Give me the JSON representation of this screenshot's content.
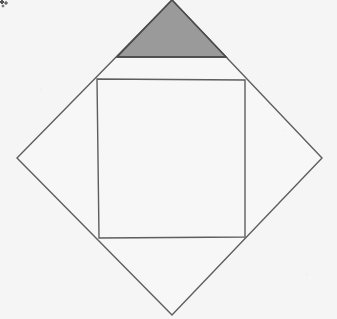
{
  "figure": {
    "canvas": {
      "width": 337,
      "height": 319,
      "background_color": "#f5f5f5"
    },
    "style": {
      "stroke_color": "#5e5e5e",
      "stroke_width": 1.4,
      "shaded_fill_color": "#9a9a9a",
      "unshaded_fill_color": "#f7f7f7"
    },
    "outer_square": {
      "name": "outer-rotated-square",
      "points": "172,0 322,158 172,315 17,158",
      "vertices": [
        {
          "label": "top",
          "x": 172,
          "y": 0
        },
        {
          "label": "right",
          "x": 322,
          "y": 158
        },
        {
          "label": "bottom",
          "x": 172,
          "y": 315
        },
        {
          "label": "left",
          "x": 17,
          "y": 158
        }
      ]
    },
    "inner_cross": {
      "name": "inner-midpoint-square",
      "points": "97,79 245,80 245,237 99,238",
      "vertices": [
        {
          "label": "upper-left-midpoint",
          "x": 97,
          "y": 79
        },
        {
          "label": "upper-right-midpoint",
          "x": 245,
          "y": 80
        },
        {
          "label": "lower-right-midpoint",
          "x": 245,
          "y": 237
        },
        {
          "label": "lower-left-midpoint",
          "x": 99,
          "y": 238
        }
      ],
      "center": {
        "x": 171,
        "y": 158
      }
    },
    "diagonals": [
      {
        "name": "diagonal-upper-left-to-lower-right",
        "x1": 97,
        "y1": 79,
        "x2": 245,
        "y2": 237
      },
      {
        "name": "diagonal-upper-right-to-lower-left",
        "x1": 245,
        "y1": 80,
        "x2": 99,
        "y2": 238
      }
    ],
    "shaded_region": {
      "name": "shaded-triangle",
      "points": "172,0 226,57 117,57",
      "fill": "#9a9a9a",
      "description": "Shaded isosceles triangle occupying the upper half of the top small square",
      "vertices": [
        {
          "label": "apex",
          "x": 172,
          "y": 0
        },
        {
          "label": "right-base",
          "x": 226,
          "y": 57
        },
        {
          "label": "left-base",
          "x": 117,
          "y": 57
        }
      ],
      "base_line": {
        "x1": 117,
        "y1": 57,
        "x2": 226,
        "y2": 57
      }
    },
    "artifacts": {
      "corner_speck": {
        "name": "scan-speck",
        "x": 0,
        "y": 0,
        "description": "scanner noise speck at top-left corner"
      }
    }
  }
}
